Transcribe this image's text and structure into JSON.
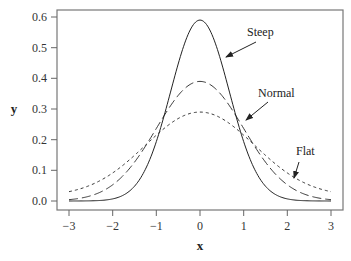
{
  "chart_data": {
    "type": "line",
    "title": "",
    "xlabel": "x",
    "ylabel": "y",
    "xlim": [
      -3,
      3
    ],
    "ylim": [
      0.0,
      0.6
    ],
    "xticks": [
      "−3",
      "−2",
      "−1",
      "0",
      "1",
      "2",
      "3"
    ],
    "yticks": [
      "0.0",
      "0.1",
      "0.2",
      "0.3",
      "0.4",
      "0.5",
      "0.6"
    ],
    "grid": false,
    "legend": "none (curves labeled by arrow annotations)",
    "series": [
      {
        "name": "Steep",
        "style": "solid",
        "peak": 0.59,
        "sigma": 0.67,
        "x": [
          -3,
          -2,
          -1,
          -0.5,
          0,
          0.5,
          1,
          2,
          3
        ],
        "values": [
          0.0,
          0.007,
          0.19,
          0.45,
          0.59,
          0.45,
          0.19,
          0.007,
          0.0
        ]
      },
      {
        "name": "Normal",
        "style": "long-dash",
        "peak": 0.39,
        "sigma": 1.0,
        "x": [
          -3,
          -2,
          -1,
          -0.5,
          0,
          0.5,
          1,
          2,
          3
        ],
        "values": [
          0.004,
          0.054,
          0.242,
          0.352,
          0.399,
          0.352,
          0.242,
          0.054,
          0.004
        ]
      },
      {
        "name": "Flat",
        "style": "short-dash",
        "peak": 0.29,
        "sigma": 1.35,
        "x": [
          -3,
          -2,
          -1,
          -0.5,
          0,
          0.5,
          1,
          2,
          3
        ],
        "values": [
          0.03,
          0.1,
          0.22,
          0.27,
          0.29,
          0.27,
          0.22,
          0.1,
          0.03
        ]
      }
    ],
    "annotations": [
      {
        "text": "Steep",
        "points_to": "Steep curve at x≈0.6"
      },
      {
        "text": "Normal",
        "points_to": "Normal curve at x≈1.2"
      },
      {
        "text": "Flat",
        "points_to": "Flat curve at x≈2.0"
      }
    ]
  },
  "labels": {
    "xlabel": "x",
    "ylabel": "y",
    "steep": "Steep",
    "normal": "Normal",
    "flat": "Flat",
    "xticks": [
      "−3",
      "−2",
      "−1",
      "0",
      "1",
      "2",
      "3"
    ],
    "yticks": [
      "0.0",
      "0.1",
      "0.2",
      "0.3",
      "0.4",
      "0.5",
      "0.6"
    ]
  }
}
